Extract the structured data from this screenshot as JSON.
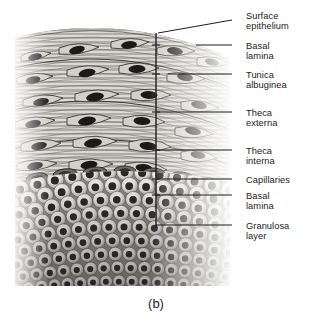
{
  "figure": {
    "caption": "(b)",
    "labels": [
      {
        "id": "surface-epithelium",
        "text": "Surface\nepithelium",
        "text_x": 246,
        "text_y": 11,
        "leader_x1": 232,
        "leader_y1": 20,
        "leader_x2": 158,
        "leader_y2": 33
      },
      {
        "id": "basal-lamina-outer",
        "text": "Basal\nlamina",
        "text_x": 246,
        "text_y": 41,
        "leader_x1": 232,
        "leader_y1": 45,
        "leader_x2": 196,
        "leader_y2": 45
      },
      {
        "id": "tunica-albuginea",
        "text": "Tunica\nalbuginea",
        "text_x": 246,
        "text_y": 70,
        "leader_x1": 232,
        "leader_y1": 74,
        "leader_x2": 168,
        "leader_y2": 74
      },
      {
        "id": "theca-externa",
        "text": "Theca\nexterna",
        "text_x": 246,
        "text_y": 108,
        "leader_x1": 232,
        "leader_y1": 112,
        "leader_x2": 156,
        "leader_y2": 112
      },
      {
        "id": "theca-interna",
        "text": "Theca\ninterna",
        "text_x": 246,
        "text_y": 146,
        "leader_x1": 232,
        "leader_y1": 150,
        "leader_x2": 156,
        "leader_y2": 150
      },
      {
        "id": "capillaries",
        "text": "Capillaries",
        "text_x": 246,
        "text_y": 175,
        "leader_x1": 232,
        "leader_y1": 179,
        "leader_x2": 156,
        "leader_y2": 179
      },
      {
        "id": "basal-lamina-inner",
        "text": "Basal\nlamina",
        "text_x": 246,
        "text_y": 191,
        "leader_x1": 232,
        "leader_y1": 195,
        "leader_x2": 156,
        "leader_y2": 195
      },
      {
        "id": "granulosa-layer",
        "text": "Granulosa\nlayer",
        "text_x": 246,
        "text_y": 221,
        "leader_x1": 232,
        "leader_y1": 225,
        "leader_x2": 156,
        "leader_y2": 225
      }
    ],
    "bracket": {
      "x": 156,
      "y_top": 33,
      "y_bottom": 228
    },
    "bracket_ticks": [
      45,
      74,
      112,
      150,
      179,
      195
    ]
  },
  "colors": {
    "label_text": "#1b1b1b",
    "leader_line": "#1d1d1d",
    "background": "#ffffff",
    "tissue_light": "#e8e6e3",
    "tissue_mid": "#9a9792",
    "tissue_dark": "#3a3733",
    "nucleus": "#1c1a18"
  }
}
